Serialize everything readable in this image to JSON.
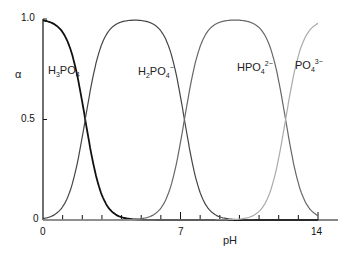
{
  "chart_data": {
    "type": "line",
    "title": "",
    "xlabel": "pH",
    "ylabel": "α",
    "xlim": [
      0,
      14
    ],
    "ylim": [
      0,
      1.0
    ],
    "x_ticks": [
      "0",
      "7",
      "14"
    ],
    "y_ticks": [
      "0",
      "0.5",
      "1.0"
    ],
    "grid": false,
    "pKa": [
      2.15,
      7.2,
      12.35
    ],
    "series": [
      {
        "name": "H3PO4",
        "label_main": "H",
        "color": "#111111",
        "x": [
          0,
          1,
          2,
          2.15,
          3,
          4,
          5
        ],
        "values": [
          0.99,
          0.93,
          0.58,
          0.5,
          0.12,
          0.01,
          0.0
        ]
      },
      {
        "name": "H2PO4-",
        "color": "#444444",
        "x": [
          0,
          1,
          2.15,
          3,
          4.7,
          6,
          7.2,
          8,
          9
        ],
        "values": [
          0.01,
          0.07,
          0.5,
          0.88,
          0.99,
          0.94,
          0.5,
          0.14,
          0.02
        ]
      },
      {
        "name": "HPO4 2-",
        "color": "#666666",
        "x": [
          5,
          6,
          7.2,
          8,
          9.8,
          11,
          12.35,
          13,
          14
        ],
        "values": [
          0.01,
          0.06,
          0.5,
          0.86,
          0.99,
          0.96,
          0.5,
          0.18,
          0.02
        ]
      },
      {
        "name": "PO4 3-",
        "color": "#aaaaaa",
        "x": [
          10,
          11,
          12.35,
          13,
          14
        ],
        "values": [
          0.0,
          0.04,
          0.5,
          0.82,
          0.98
        ]
      }
    ]
  },
  "labels": {
    "h3po4": {
      "a": "H",
      "s1": "3",
      "b": "PO",
      "s2": "4"
    },
    "h2po4": {
      "a": "H",
      "s1": "2",
      "b": "PO",
      "s2": "4",
      "sup": "−"
    },
    "hpo4": {
      "a": "HPO",
      "s2": "4",
      "sup": "2−"
    },
    "po4": {
      "a": "PO",
      "s2": "4",
      "sup": "3−"
    },
    "alpha": "α",
    "ph": "pH",
    "y1": "1.0",
    "y05": "0.5",
    "y0": "0",
    "x0": "0",
    "x7": "7",
    "x14": "14"
  }
}
